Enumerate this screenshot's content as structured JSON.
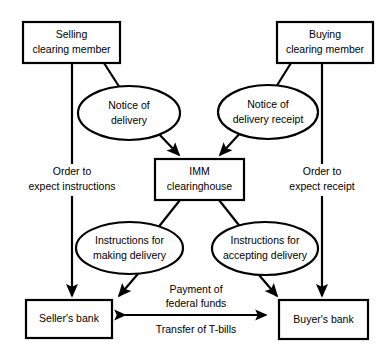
{
  "diagram": {
    "stroke_color": "#000000",
    "background_color": "#ffffff",
    "nodes": [
      {
        "id": "selling-clearing-member",
        "shape": "rectangle",
        "line1": "Selling",
        "line2": "clearing member"
      },
      {
        "id": "buying-clearing-member",
        "shape": "rectangle",
        "line1": "Buying",
        "line2": "clearing member"
      },
      {
        "id": "notice-of-delivery",
        "shape": "ellipse",
        "line1": "Notice of",
        "line2": "delivery"
      },
      {
        "id": "notice-of-delivery-receipt",
        "shape": "ellipse",
        "line1": "Notice of",
        "line2": "delivery receipt"
      },
      {
        "id": "imm-clearinghouse",
        "shape": "rectangle",
        "line1": "IMM",
        "line2": "clearinghouse"
      },
      {
        "id": "instructions-making-delivery",
        "shape": "ellipse",
        "line1": "Instructions for",
        "line2": "making delivery"
      },
      {
        "id": "instructions-accepting-delivery",
        "shape": "ellipse",
        "line1": "Instructions for",
        "line2": "accepting delivery"
      },
      {
        "id": "sellers-bank",
        "shape": "rectangle",
        "line1": "Seller's bank",
        "line2": ""
      },
      {
        "id": "buyers-bank",
        "shape": "rectangle",
        "line1": "Buyer's bank",
        "line2": ""
      }
    ],
    "edge_labels": [
      {
        "id": "order-to-expect-instructions",
        "line1": "Order to",
        "line2": "expect instructions"
      },
      {
        "id": "order-to-expect-receipt",
        "line1": "Order to",
        "line2": "expect receipt"
      },
      {
        "id": "payment-of-federal-funds",
        "line1": "Payment of",
        "line2": "federal funds"
      },
      {
        "id": "transfer-of-t-bills",
        "line1": "Transfer of T-bills",
        "line2": ""
      }
    ]
  }
}
